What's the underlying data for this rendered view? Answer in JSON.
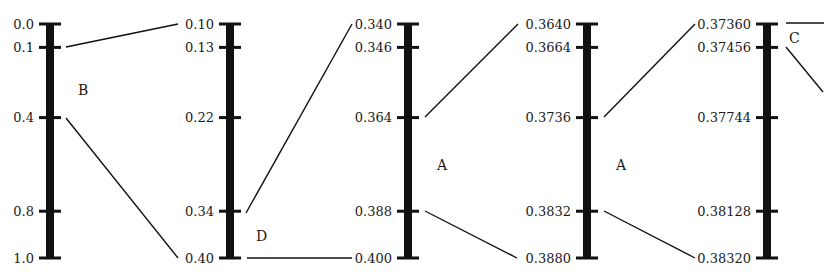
{
  "diagram": {
    "colors": {
      "ink": "#111111",
      "background": "#ffffff"
    },
    "layout": {
      "top_y": 24,
      "bottom_y": 258,
      "tick_fractions": [
        0,
        0.1,
        0.4,
        0.8,
        1.0
      ]
    },
    "axes": [
      {
        "id": "axis-1",
        "center_x": 50,
        "labels": [
          "0.0",
          "0.1",
          "0.4",
          "0.8",
          "1.0"
        ],
        "segment_label": {
          "text": "B",
          "x": 78,
          "y": 95
        }
      },
      {
        "id": "axis-2",
        "center_x": 230,
        "labels": [
          "0.10",
          "0.13",
          "0.22",
          "0.34",
          "0.40"
        ],
        "segment_label": {
          "text": "D",
          "x": 256,
          "y": 241
        }
      },
      {
        "id": "axis-3",
        "center_x": 408,
        "labels": [
          "0.340",
          "0.346",
          "0.364",
          "0.388",
          "0.400"
        ],
        "segment_label": {
          "text": "A",
          "x": 437,
          "y": 170
        }
      },
      {
        "id": "axis-4",
        "center_x": 587,
        "labels": [
          "0.3640",
          "0.3664",
          "0.3736",
          "0.3832",
          "0.3880"
        ],
        "segment_label": {
          "text": "A",
          "x": 616,
          "y": 170
        }
      },
      {
        "id": "axis-5",
        "center_x": 767,
        "labels": [
          "0.37360",
          "0.37456",
          "0.37744",
          "0.38128",
          "0.38320"
        ],
        "segment_label": {
          "text": "C",
          "x": 789,
          "y": 43
        }
      }
    ],
    "connectors": [
      {
        "from": [
          66,
          47
        ],
        "to": [
          178,
          24
        ]
      },
      {
        "from": [
          66,
          118
        ],
        "to": [
          178,
          258
        ]
      },
      {
        "from": [
          246,
          213
        ],
        "to": [
          352,
          24
        ]
      },
      {
        "from": [
          247,
          258
        ],
        "to": [
          352,
          258
        ]
      },
      {
        "from": [
          425,
          117
        ],
        "to": [
          518,
          24
        ]
      },
      {
        "from": [
          425,
          211
        ],
        "to": [
          517,
          258
        ]
      },
      {
        "from": [
          604,
          117
        ],
        "to": [
          695,
          24
        ]
      },
      {
        "from": [
          604,
          211
        ],
        "to": [
          695,
          258
        ]
      },
      {
        "from": [
          786,
          23
        ],
        "to": [
          824,
          23
        ]
      },
      {
        "from": [
          786,
          47
        ],
        "to": [
          823,
          92
        ]
      }
    ]
  }
}
